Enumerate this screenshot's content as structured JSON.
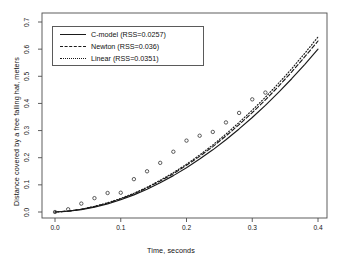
{
  "chart_data": {
    "type": "scatter",
    "title": "",
    "subtitle": "",
    "xlabel": "Time, seconds",
    "ylabel": "Distance covered by a free falling hat, meters",
    "xlim": [
      -0.012,
      0.412
    ],
    "ylim": [
      -0.018,
      0.735
    ],
    "xticks": [
      0.0,
      0.1,
      0.2,
      0.3,
      0.4
    ],
    "xtick_labels": [
      "0.0",
      "0.1",
      "0.2",
      "0.3",
      "0.4"
    ],
    "yticks": [
      0.0,
      0.1,
      0.2,
      0.3,
      0.4,
      0.5,
      0.6,
      0.7
    ],
    "ytick_labels": [
      "0.0",
      "0.1",
      "0.2",
      "0.3",
      "0.4",
      "0.5",
      "0.6",
      "0.7"
    ],
    "grid": false,
    "legend_position": "top-left",
    "frame": true,
    "observed": {
      "name": "observed data",
      "marker": "open-circle",
      "x": [
        0.0,
        0.02,
        0.04,
        0.06,
        0.08,
        0.1,
        0.12,
        0.14,
        0.16,
        0.18,
        0.2,
        0.22,
        0.24,
        0.26,
        0.28,
        0.3,
        0.32
      ],
      "y": [
        0.0,
        0.01,
        0.031,
        0.051,
        0.07,
        0.071,
        0.121,
        0.15,
        0.181,
        0.222,
        0.263,
        0.281,
        0.295,
        0.33,
        0.365,
        0.415,
        0.44
      ]
    },
    "series": [
      {
        "name": "C-model",
        "label": "C-model (RSS=0.0257)",
        "rss": 0.0257,
        "linestyle": "solid",
        "color": "#1a1a1a",
        "x": [
          0.0,
          0.02,
          0.04,
          0.06,
          0.08,
          0.1,
          0.12,
          0.14,
          0.16,
          0.18,
          0.2,
          0.22,
          0.24,
          0.26,
          0.28,
          0.3,
          0.32,
          0.34,
          0.36,
          0.38,
          0.4
        ],
        "y": [
          0.0,
          0.003,
          0.009,
          0.018,
          0.03,
          0.045,
          0.063,
          0.084,
          0.108,
          0.134,
          0.163,
          0.195,
          0.229,
          0.266,
          0.306,
          0.348,
          0.393,
          0.441,
          0.491,
          0.544,
          0.6
        ]
      },
      {
        "name": "Newton",
        "label": "Newton (RSS=0.036)",
        "rss": 0.036,
        "linestyle": "dashed",
        "color": "#1a1a1a",
        "x": [
          0.0,
          0.02,
          0.04,
          0.06,
          0.08,
          0.1,
          0.12,
          0.14,
          0.16,
          0.18,
          0.2,
          0.22,
          0.24,
          0.26,
          0.28,
          0.3,
          0.32,
          0.34,
          0.36,
          0.38,
          0.4
        ],
        "y": [
          0.0,
          0.003,
          0.01,
          0.02,
          0.033,
          0.048,
          0.067,
          0.089,
          0.114,
          0.141,
          0.172,
          0.205,
          0.241,
          0.28,
          0.322,
          0.366,
          0.413,
          0.463,
          0.516,
          0.572,
          0.63
        ]
      },
      {
        "name": "Linear",
        "label": "Linear (RSS=0.0351)",
        "rss": 0.0351,
        "linestyle": "dotted",
        "color": "#1a1a1a",
        "x": [
          0.0,
          0.02,
          0.04,
          0.06,
          0.08,
          0.1,
          0.12,
          0.14,
          0.16,
          0.18,
          0.2,
          0.22,
          0.24,
          0.26,
          0.28,
          0.3,
          0.32,
          0.34,
          0.36,
          0.38,
          0.4
        ],
        "y": [
          0.0,
          0.003,
          0.01,
          0.021,
          0.034,
          0.05,
          0.069,
          0.091,
          0.117,
          0.145,
          0.176,
          0.21,
          0.247,
          0.287,
          0.33,
          0.375,
          0.423,
          0.474,
          0.528,
          0.585,
          0.645
        ]
      }
    ]
  },
  "legend": {
    "entries": [
      {
        "label": "C-model (RSS=0.0257)",
        "style": "solid"
      },
      {
        "label": "Newton (RSS=0.036)",
        "style": "dashed"
      },
      {
        "label": "Linear (RSS=0.0351)",
        "style": "dotted"
      }
    ]
  },
  "axes": {
    "x_title": "Time, seconds",
    "y_title": "Distance covered by a free falling hat, meters"
  }
}
